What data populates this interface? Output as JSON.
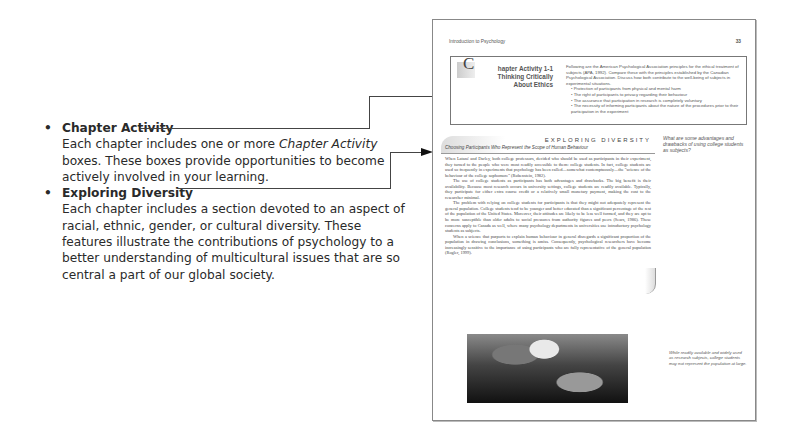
{
  "explanations": [
    {
      "title": "Chapter Activity",
      "text_before": "Each chapter includes one or more ",
      "text_em": "Chapter Activity",
      "text_after": " boxes. These boxes provide opportunities to become actively involved in your learning."
    },
    {
      "title": "Exploring Diversity",
      "text": "Each chapter includes a section devoted to an aspect of racial, ethnic, gender, or cultural diversity. These features illustrate the contributions of psychology to a better understanding of multicultural issues that are so central a part of our global society."
    }
  ],
  "page": {
    "running_head": "Introduction to Psychology",
    "page_number": "33",
    "activity": {
      "drop_cap": "C",
      "title_line1": "hapter Activity 1-1",
      "title_line2": "Thinking Critically",
      "title_line3": "About Ethics",
      "intro": "Following are the American Psychological Association principles for the ethical treatment of subjects (APA, 1992). Compare these with the principles established by the Canadian Psychological Association. Discuss how both contribute to the well-being of subjects in experimental situations.",
      "bullets": [
        "Protection of participants from physical and mental harm",
        "The right of participants to privacy regarding their behaviour",
        "The assurance that participation in research is completely voluntary",
        "The necessity of informing participants about the nature of the procedures prior to their participation in the experiment"
      ]
    },
    "exploring_diversity": {
      "label": "EXPLORING DIVERSITY",
      "subtitle": "Choosing Participants Who Represent the Scope of Human Behaviour",
      "margin_question": "What are some advantages and drawbacks of using college students as subjects?",
      "paragraphs": [
        "When Latané and Darley, both college professors, decided who should be used as participants in their experiment, they turned to the people who were most readily accessible to them: college students. In fact, college students are used so frequently in experiments that psychology has been called—somewhat contemptuously—the \"science of the behaviour of the college sophomore\" (Rubenstein, 1982).",
        "The use of college students as participants has both advantages and drawbacks. The big benefit is their availability. Because most research occurs in university settings, college students are readily available. Typically, they participate for either extra course credit or a relatively small monetary payment, making the cost to the researcher minimal.",
        "The problem with relying on college students for participants is that they might not adequately represent the general population. College students tend to be younger and better educated than a significant percentage of the rest of the population of the United States. Moreover, their attitudes are likely to be less well formed, and they are apt to be more susceptible than older adults to social pressures from authority figures and peers (Sears, 1986). These concerns apply to Canada as well, where many psychology departments in universities use introductory psychology students as subjects.",
        "When a science that purports to explain human behaviour in general disregards a significant proportion of the population in drawing conclusions, something is amiss. Consequently, psychological researchers have become increasingly sensitive to the importance of using participants who are fully representative of the general population (Rogler, 1999)."
      ],
      "photo_caption": "While readily available and widely used as research subjects, college students may not represent the population at large."
    }
  }
}
